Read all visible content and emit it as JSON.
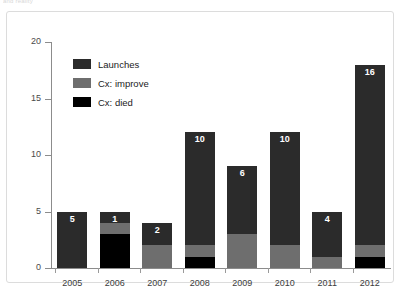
{
  "caption": "and reality",
  "chart_data": {
    "type": "bar",
    "stacked": true,
    "title": "",
    "subtitle": "",
    "xlabel": "",
    "ylabel": "",
    "categories": [
      "2005",
      "2006",
      "2007",
      "2008",
      "2009",
      "2010",
      "2011",
      "2012"
    ],
    "ylim": [
      0,
      20
    ],
    "yticks": [
      0,
      5,
      10,
      15,
      20
    ],
    "ytick_labels": [
      "0",
      "5",
      "10",
      "15",
      "20"
    ],
    "grid": false,
    "legend_position": "upper left",
    "series": [
      {
        "name": "Cx: died",
        "color": "#000000",
        "values": [
          0,
          3,
          0,
          1,
          0,
          0,
          0,
          1
        ]
      },
      {
        "name": "Cx: improve",
        "color": "#6e6e6e",
        "values": [
          0,
          1,
          2,
          1,
          3,
          2,
          1,
          1
        ]
      },
      {
        "name": "Launches",
        "color": "#2b2b2b",
        "values": [
          5,
          1,
          2,
          10,
          6,
          10,
          4,
          16
        ]
      }
    ],
    "bar_labels": [
      "5",
      "1",
      "2",
      "10",
      "6",
      "10",
      "4",
      "16"
    ],
    "totals": [
      5,
      5,
      4,
      12,
      9,
      12,
      5,
      18
    ],
    "annotations": []
  },
  "legend": {
    "items": [
      {
        "label": "Launches",
        "color": "#2b2b2b"
      },
      {
        "label": "Cx: improve",
        "color": "#6e6e6e"
      },
      {
        "label": "Cx: died",
        "color": "#000000"
      }
    ]
  },
  "colors": {
    "launches": "#2b2b2b",
    "improve": "#6e6e6e",
    "died": "#000000",
    "axis": "#8c8c8c",
    "frame": "#dcdcdc",
    "tick_text": "#4a4a4a",
    "label_text": "#ffffff"
  }
}
